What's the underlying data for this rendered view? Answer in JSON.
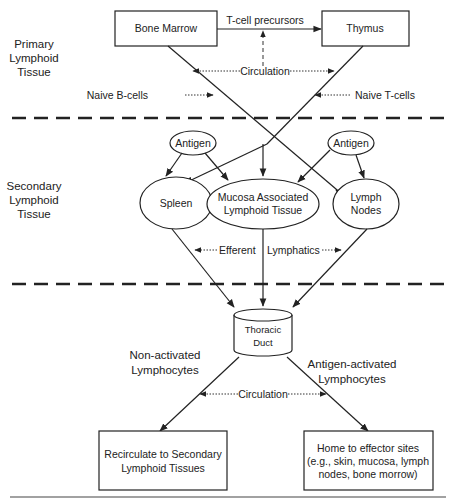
{
  "regions": {
    "primary": {
      "line1": "Primary",
      "line2": "Lymphoid",
      "line3": "Tissue"
    },
    "secondary": {
      "line1": "Secondary",
      "line2": "Lymphoid",
      "line3": "Tissue"
    }
  },
  "nodes": {
    "bone_marrow": "Bone Marrow",
    "thymus": "Thymus",
    "antigen_left": "Antigen",
    "antigen_right": "Antigen",
    "spleen": "Spleen",
    "malt": {
      "line1": "Mucosa Associated",
      "line2": "Lymphoid Tissue"
    },
    "lymph_nodes": {
      "line1": "Lymph",
      "line2": "Nodes"
    },
    "thoracic_duct": {
      "line1": "Thoracic",
      "line2": "Duct"
    },
    "recirculate": {
      "line1": "Recirculate to Secondary",
      "line2": "Lymphoid Tissues"
    },
    "home": {
      "line1": "Home to effector sites",
      "line2": "(e.g., skin, mucosa, lymph",
      "line3": "nodes, bone morrow)"
    }
  },
  "edge_labels": {
    "t_cell_precursors": "T-cell precursors",
    "circulation_top": "Circulation",
    "naive_b_cells": "Naive B-cells",
    "naive_t_cells": "Naive T-cells",
    "efferent": "Efferent",
    "lymphatics": "Lymphatics",
    "non_activated": {
      "line1": "Non-activated",
      "line2": "Lymphocytes"
    },
    "antigen_activated": {
      "line1": "Antigen-activated",
      "line2": "Lymphocytes"
    },
    "circulation_bottom": "Circulation"
  }
}
